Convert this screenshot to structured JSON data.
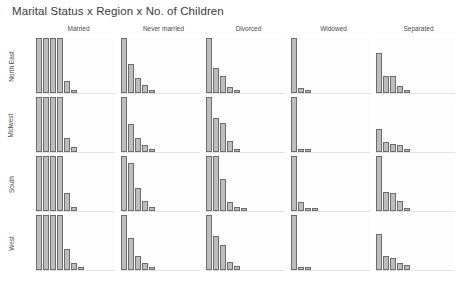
{
  "title": "Marital Status x Region x No. of Children",
  "columns": [
    {
      "label": "Married"
    },
    {
      "label": "Never married"
    },
    {
      "label": "Divorced"
    },
    {
      "label": "Widowed"
    },
    {
      "label": "Separated"
    }
  ],
  "rows": [
    {
      "label": "North East"
    },
    {
      "label": "Midwest"
    },
    {
      "label": "South"
    },
    {
      "label": "West"
    }
  ],
  "colors": {
    "bar_fill": "#bdbdbd",
    "bar_stroke": "#6d6d6d",
    "panel_bg": "#fdfdfd",
    "baseline": "#e2e2e2",
    "text": "#4a4a4a",
    "title": "#3a3a3a"
  },
  "chart_data": {
    "type": "bar",
    "title": "Marital Status x Region x No. of Children",
    "xlabel": "No. of Children",
    "ylabel": "",
    "grid": false,
    "legend": null,
    "facet_rows": [
      "North East",
      "Midwest",
      "South",
      "West"
    ],
    "facet_cols": [
      "Married",
      "Never married",
      "Divorced",
      "Widowed",
      "Separated"
    ],
    "categories": [
      "0",
      "1",
      "2",
      "3",
      "4",
      "5",
      "6",
      "7"
    ],
    "ylim": [
      0,
      100
    ],
    "note": "Each facet panel shows counts by number of children; first Married bars are clipped at panel top.",
    "panels": [
      {
        "row": "North East",
        "col": "Married",
        "values": [
          100,
          100,
          100,
          100,
          22,
          5,
          0,
          0
        ]
      },
      {
        "row": "North East",
        "col": "Never married",
        "values": [
          100,
          52,
          28,
          15,
          6,
          0,
          0,
          0
        ]
      },
      {
        "row": "North East",
        "col": "Divorced",
        "values": [
          100,
          45,
          30,
          10,
          2,
          0,
          0,
          0
        ]
      },
      {
        "row": "North East",
        "col": "Widowed",
        "values": [
          100,
          9,
          2,
          0,
          0,
          0,
          0,
          0
        ]
      },
      {
        "row": "North East",
        "col": "Separated",
        "values": [
          72,
          30,
          30,
          12,
          2,
          0,
          0,
          0
        ]
      },
      {
        "row": "Midwest",
        "col": "Married",
        "values": [
          100,
          100,
          100,
          100,
          26,
          9,
          0,
          0
        ]
      },
      {
        "row": "Midwest",
        "col": "Never married",
        "values": [
          100,
          50,
          26,
          13,
          5,
          0,
          0,
          0
        ]
      },
      {
        "row": "Midwest",
        "col": "Divorced",
        "values": [
          100,
          62,
          52,
          20,
          5,
          0,
          0,
          0
        ]
      },
      {
        "row": "Midwest",
        "col": "Widowed",
        "values": [
          100,
          6,
          5,
          0,
          0,
          0,
          0,
          0
        ]
      },
      {
        "row": "Midwest",
        "col": "Separated",
        "values": [
          42,
          19,
          14,
          12,
          3,
          0,
          0,
          0
        ]
      },
      {
        "row": "South",
        "col": "Married",
        "values": [
          100,
          100,
          100,
          100,
          32,
          8,
          0,
          0
        ]
      },
      {
        "row": "South",
        "col": "Never married",
        "values": [
          100,
          88,
          42,
          18,
          8,
          0,
          0,
          0
        ]
      },
      {
        "row": "South",
        "col": "Divorced",
        "values": [
          100,
          100,
          58,
          17,
          8,
          2,
          0,
          0
        ]
      },
      {
        "row": "South",
        "col": "Widowed",
        "values": [
          100,
          16,
          6,
          2,
          0,
          0,
          0,
          0
        ]
      },
      {
        "row": "South",
        "col": "Separated",
        "values": [
          100,
          35,
          33,
          18,
          4,
          0,
          0,
          0
        ]
      },
      {
        "row": "West",
        "col": "Married",
        "values": [
          100,
          100,
          100,
          100,
          38,
          13,
          6,
          0
        ]
      },
      {
        "row": "West",
        "col": "Never married",
        "values": [
          100,
          58,
          26,
          12,
          6,
          0,
          0,
          0
        ]
      },
      {
        "row": "West",
        "col": "Divorced",
        "values": [
          100,
          62,
          45,
          15,
          7,
          0,
          0,
          0
        ]
      },
      {
        "row": "West",
        "col": "Widowed",
        "values": [
          100,
          5,
          5,
          0,
          0,
          0,
          0,
          0
        ]
      },
      {
        "row": "West",
        "col": "Separated",
        "values": [
          66,
          26,
          22,
          13,
          9,
          0,
          0,
          0
        ]
      }
    ]
  }
}
